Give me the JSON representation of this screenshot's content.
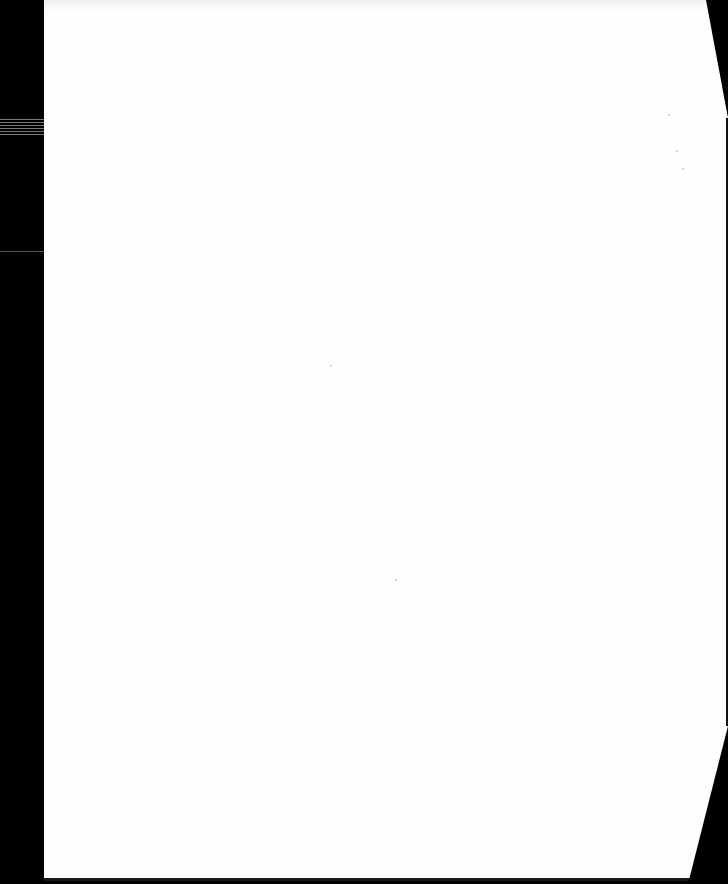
{
  "document": {
    "type": "scanned-page",
    "content": "",
    "colors": {
      "paper": "#fefefe",
      "background": "#000000"
    }
  }
}
